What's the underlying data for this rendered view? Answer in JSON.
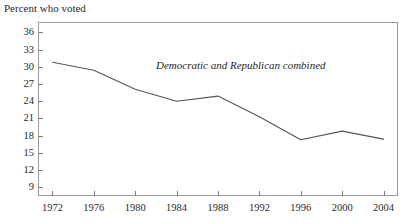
{
  "chart_data": {
    "type": "line",
    "title": "Percent who voted",
    "xlabel": "",
    "ylabel": "",
    "grid": false,
    "legend_position": "inline-annotation",
    "annotations": [
      {
        "text": "Democratic and Republican combined"
      }
    ],
    "categories": [
      1972,
      1976,
      1980,
      1984,
      1988,
      1992,
      1996,
      2000,
      2004
    ],
    "x_tick_labels": [
      "1972",
      "1976",
      "1980",
      "1984",
      "1988",
      "1992",
      "1996",
      "2000",
      "2004"
    ],
    "y_tick_labels": [
      "36",
      "33",
      "30",
      "27",
      "24",
      "21",
      "18",
      "15",
      "12",
      "9"
    ],
    "y_ticks": [
      36,
      33,
      30,
      27,
      24,
      21,
      18,
      15,
      12,
      9
    ],
    "ylim": [
      7.5,
      37.8
    ],
    "xlim": [
      1970.6,
      2005.4
    ],
    "series": [
      {
        "name": "Democratic and Republican combined",
        "values": [
          30.8,
          29.4,
          26.1,
          24.0,
          24.9,
          21.3,
          17.3,
          18.8,
          17.4
        ],
        "color": "#555555"
      }
    ]
  },
  "style": {
    "axis_color": "#9a9a9a",
    "tick_color": "#7d7d7d",
    "text_color": "#2a2a2a",
    "background": "#ffffff"
  }
}
